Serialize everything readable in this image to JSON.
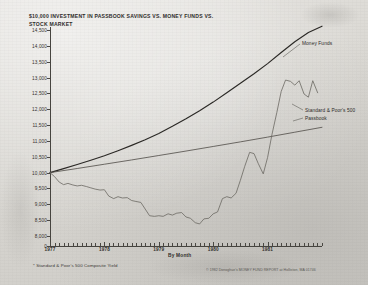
{
  "chart_data": {
    "type": "line",
    "title": "$10,000 INVESTMENT IN PASSBOOK SAVINGS VS. MONEY FUNDS VS. STOCK MARKET",
    "title_footnote_marker": "*",
    "xlabel": "By Month",
    "ylabel": "Dollars",
    "ylim": [
      8000,
      14500
    ],
    "baseline_tick": "0",
    "grid": false,
    "legend_position": "inline-right",
    "ytick_labels": [
      "14,500",
      "14,000",
      "13,500",
      "13,000",
      "12,500",
      "12,000",
      "11,500",
      "11,000",
      "10,500",
      "10,000",
      "9,500",
      "9,000",
      "8,500",
      "8,000",
      "0"
    ],
    "ytick_values": [
      14500,
      14000,
      13500,
      13000,
      12500,
      12000,
      11500,
      11000,
      10500,
      10000,
      9500,
      9000,
      8500,
      8000,
      0
    ],
    "xtick_labels": [
      "1977",
      "1978",
      "1979",
      "1980",
      "1981"
    ],
    "xtick_values": [
      1977,
      1978,
      1979,
      1980,
      1981
    ],
    "x_minor_ticks_per_year": 12,
    "footnote": "Standard & Poor's 500 Composite Yield",
    "copyright": "© 1982 Donoghue's MONEY FUND REPORT at Holliston, MA 01746",
    "series": [
      {
        "name": "Money Funds",
        "color": "#2a2825",
        "label": "Money Funds",
        "x": [
          1977.0,
          1977.25,
          1977.5,
          1977.75,
          1978.0,
          1978.25,
          1978.5,
          1978.75,
          1979.0,
          1979.25,
          1979.5,
          1979.75,
          1980.0,
          1980.25,
          1980.5,
          1980.75,
          1981.0,
          1981.25,
          1981.5,
          1981.75,
          1982.0
        ],
        "values": [
          10000,
          10125,
          10255,
          10390,
          10530,
          10690,
          10860,
          11040,
          11235,
          11460,
          11700,
          11955,
          12225,
          12520,
          12820,
          13120,
          13440,
          13790,
          14130,
          14420,
          14620
        ]
      },
      {
        "name": "Passbook",
        "color": "#56534e",
        "label": "Passbook",
        "x": [
          1977.0,
          1977.5,
          1978.0,
          1978.5,
          1979.0,
          1979.5,
          1980.0,
          1980.5,
          1981.0,
          1981.5,
          1982.0
        ],
        "values": [
          10000,
          10130,
          10265,
          10400,
          10540,
          10680,
          10825,
          10970,
          11120,
          11275,
          11430
        ]
      },
      {
        "name": "Standard & Poor's 500",
        "color": "#6b6862",
        "label": "Standard & Poor's 500",
        "x": [
          1977.0,
          1977.08,
          1977.17,
          1977.25,
          1977.33,
          1977.42,
          1977.5,
          1977.58,
          1977.67,
          1977.75,
          1977.83,
          1977.92,
          1978.0,
          1978.08,
          1978.17,
          1978.25,
          1978.33,
          1978.42,
          1978.5,
          1978.58,
          1978.67,
          1978.75,
          1978.83,
          1978.92,
          1979.0,
          1979.08,
          1979.17,
          1979.25,
          1979.33,
          1979.42,
          1979.5,
          1979.58,
          1979.67,
          1979.75,
          1979.83,
          1979.92,
          1980.0,
          1980.08,
          1980.17,
          1980.25,
          1980.33,
          1980.42,
          1980.5,
          1980.58,
          1980.67,
          1980.75,
          1980.83,
          1980.92,
          1981.0,
          1981.08,
          1981.17,
          1981.25,
          1981.33,
          1981.42,
          1981.5,
          1981.58,
          1981.67,
          1981.75,
          1981.83,
          1981.92
        ],
        "values": [
          10000,
          9880,
          9700,
          9620,
          9660,
          9610,
          9580,
          9600,
          9560,
          9520,
          9480,
          9450,
          9460,
          9260,
          9180,
          9240,
          9200,
          9210,
          9120,
          9090,
          9060,
          8850,
          8640,
          8620,
          8640,
          8620,
          8700,
          8660,
          8720,
          8740,
          8600,
          8560,
          8420,
          8380,
          8540,
          8560,
          8700,
          8760,
          9180,
          9240,
          9200,
          9350,
          9760,
          10200,
          10640,
          10600,
          10280,
          9960,
          10480,
          11200,
          11900,
          12560,
          12920,
          12880,
          12760,
          12900,
          12480,
          12380,
          12900,
          12520
        ]
      }
    ]
  }
}
